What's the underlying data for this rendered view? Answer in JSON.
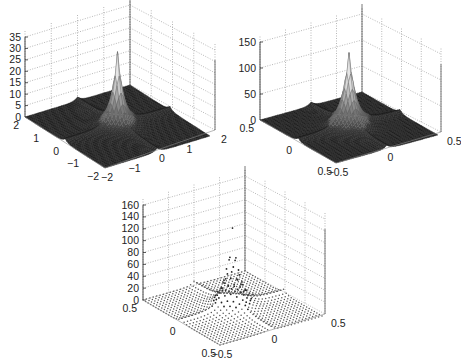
{
  "figure": {
    "panels": 3,
    "background": "#ffffff"
  },
  "chart_data": [
    {
      "type": "surface",
      "render": "mesh",
      "title": "",
      "xlabel": "",
      "ylabel": "",
      "zlabel": "",
      "x_range": [
        -2,
        2
      ],
      "y_range": [
        -2,
        2
      ],
      "zlim": [
        0,
        35
      ],
      "z_ticks": [
        0,
        5,
        10,
        15,
        20,
        25,
        30,
        35
      ],
      "left_axis_ticks": [
        "2",
        "1",
        "0",
        "−1",
        "−2"
      ],
      "right_axis_ticks": [
        "−2",
        "−1",
        "0",
        "1",
        "2"
      ],
      "peak": 35,
      "grid": true,
      "color": "#2a2a2a",
      "geometry": {
        "zaxis_x": 25,
        "z0_y": 117,
        "ztop_y": 37,
        "floor": {
          "left": [
            25,
            117
          ],
          "front": [
            105,
            168
          ],
          "right": [
            215,
            130
          ],
          "back": [
            130,
            85
          ]
        },
        "height_px": 80
      }
    },
    {
      "type": "surface",
      "render": "mesh",
      "title": "",
      "xlabel": "",
      "ylabel": "",
      "zlabel": "",
      "x_range": [
        -0.5,
        0.5
      ],
      "y_range": [
        -0.5,
        0.5
      ],
      "zlim": [
        0,
        150
      ],
      "z_ticks": [
        0,
        50,
        100,
        150
      ],
      "left_axis_ticks": [
        "0.5",
        "0",
        ""
      ],
      "right_axis_ticks": [
        "−0.5",
        "0",
        "0.5"
      ],
      "front_label": "0.5",
      "peak": 150,
      "grid": true,
      "color": "#2a2a2a",
      "geometry": {
        "zaxis_x": 260,
        "z0_y": 120,
        "ztop_y": 42,
        "floor": {
          "left": [
            260,
            120
          ],
          "front": [
            336,
            163
          ],
          "right": [
            441,
            132
          ],
          "back": [
            362,
            92
          ]
        },
        "height_px": 78
      }
    },
    {
      "type": "surface",
      "render": "points",
      "title": "",
      "xlabel": "",
      "ylabel": "",
      "zlabel": "",
      "x_range": [
        -0.5,
        0.5
      ],
      "y_range": [
        -0.5,
        0.5
      ],
      "zlim": [
        0,
        160
      ],
      "z_ticks": [
        0,
        20,
        40,
        60,
        80,
        100,
        120,
        140,
        160
      ],
      "left_axis_ticks": [
        "0.5",
        "0",
        ""
      ],
      "right_axis_ticks": [
        "−0.5",
        "0",
        "0.5"
      ],
      "front_label": "0.5",
      "peak": 140,
      "grid": true,
      "color": "#2a2a2a",
      "geometry": {
        "zaxis_x": 143,
        "z0_y": 300,
        "ztop_y": 205,
        "floor": {
          "left": [
            143,
            300
          ],
          "front": [
            220,
            345
          ],
          "right": [
            325,
            314
          ],
          "back": [
            245,
            271
          ]
        },
        "height_px": 95
      }
    }
  ]
}
